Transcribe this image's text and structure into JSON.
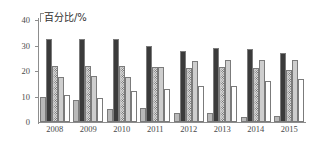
{
  "chart_data": {
    "type": "bar",
    "title": "百分比/%",
    "xlabel": "",
    "ylabel": "百分比/%",
    "ylim": [
      0,
      40
    ],
    "ytick_labels": [
      "0",
      "10",
      "20",
      "30",
      "40"
    ],
    "yticks": [
      0,
      10,
      20,
      30,
      40
    ],
    "grid": false,
    "legend": "none",
    "categories": [
      "2008",
      "2009",
      "2010",
      "2011",
      "2012",
      "2013",
      "2014",
      "2015"
    ],
    "series": [
      {
        "name": "series-1",
        "pattern": "solid-light-gray",
        "color": "#b9b9b9",
        "values": [
          10,
          8.5,
          5,
          5.5,
          3.5,
          3.5,
          2,
          2.5
        ]
      },
      {
        "name": "series-2",
        "pattern": "solid-dark",
        "color": "#3b3b3b",
        "values": [
          32.5,
          32.5,
          32.5,
          30,
          28,
          29,
          28.5,
          27
        ]
      },
      {
        "name": "series-3",
        "pattern": "dotted-stipple",
        "color": "#d9d9d9",
        "values": [
          22,
          22,
          22,
          21.5,
          21,
          21.5,
          21,
          20.5
        ]
      },
      {
        "name": "series-4",
        "pattern": "solid-gray",
        "color": "#cecece",
        "values": [
          17.5,
          18,
          17.5,
          21.5,
          24,
          24.5,
          24.5,
          24.5
        ]
      }
    ],
    "extra_series_note": "each year group shows four bars left to right",
    "group_fifth": {
      "name": "series-5",
      "pattern": "solid-light-gray",
      "color": "#cecece",
      "values": [
        10.5,
        9.5,
        12,
        13,
        14,
        14,
        16,
        17
      ]
    }
  }
}
